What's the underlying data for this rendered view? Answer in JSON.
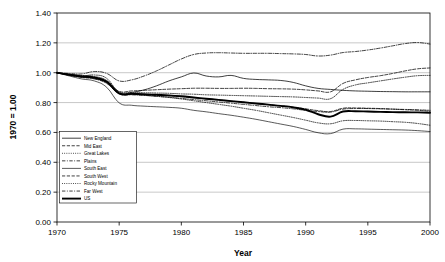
{
  "chart_data": {
    "type": "line",
    "title": "",
    "xlabel": "Year",
    "ylabel": "1970 = 1.00",
    "xlim": [
      1970,
      2000
    ],
    "ylim": [
      0.0,
      1.4
    ],
    "grid": true,
    "legend_position": "inside-lower-left",
    "xticks": [
      "1970",
      "1975",
      "1980",
      "1985",
      "1990",
      "1995",
      "2000"
    ],
    "xtick_values": [
      1970,
      1975,
      1980,
      1985,
      1990,
      1995,
      2000
    ],
    "yticks": [
      "0.00",
      "0.20",
      "0.40",
      "0.60",
      "0.80",
      "1.00",
      "1.20",
      "1.40"
    ],
    "ytick_values": [
      0.0,
      0.2,
      0.4,
      0.6,
      0.8,
      1.0,
      1.2,
      1.4
    ],
    "x": [
      1970,
      1971,
      1972,
      1973,
      1974,
      1975,
      1976,
      1977,
      1978,
      1979,
      1980,
      1981,
      1982,
      1983,
      1984,
      1985,
      1986,
      1987,
      1988,
      1989,
      1990,
      1991,
      1992,
      1993,
      1994,
      1995,
      1996,
      1997,
      1998,
      1999,
      2000
    ],
    "series": [
      {
        "name": "New England",
        "style": "solid",
        "width": 0.75,
        "values": [
          1.0,
          0.985,
          0.972,
          0.962,
          0.935,
          0.862,
          0.868,
          0.885,
          0.912,
          0.945,
          0.972,
          0.998,
          0.978,
          0.972,
          0.982,
          0.962,
          0.955,
          0.952,
          0.948,
          0.935,
          0.912,
          0.895,
          0.888,
          0.882,
          0.878,
          0.876,
          0.874,
          0.873,
          0.872,
          0.872,
          0.872
        ]
      },
      {
        "name": "Mid East",
        "style": "dashed",
        "width": 0.75,
        "values": [
          1.0,
          0.988,
          0.978,
          0.968,
          0.94,
          0.875,
          0.878,
          0.882,
          0.886,
          0.89,
          0.893,
          0.896,
          0.896,
          0.895,
          0.895,
          0.896,
          0.895,
          0.893,
          0.892,
          0.89,
          0.885,
          0.878,
          0.872,
          0.928,
          0.952,
          0.968,
          0.98,
          0.995,
          1.012,
          1.026,
          1.032
        ]
      },
      {
        "name": "Great Lakes",
        "style": "dotted",
        "width": 0.75,
        "values": [
          1.0,
          0.99,
          0.982,
          0.975,
          0.948,
          0.872,
          0.868,
          0.866,
          0.864,
          0.862,
          0.858,
          0.856,
          0.852,
          0.85,
          0.848,
          0.846,
          0.844,
          0.842,
          0.84,
          0.838,
          0.834,
          0.83,
          0.826,
          0.888,
          0.918,
          0.932,
          0.945,
          0.958,
          0.97,
          0.98,
          0.982
        ]
      },
      {
        "name": "Plains",
        "style": "dashdot",
        "width": 0.75,
        "values": [
          1.0,
          0.982,
          0.968,
          0.958,
          0.928,
          0.858,
          0.852,
          0.848,
          0.842,
          0.836,
          0.828,
          0.82,
          0.812,
          0.804,
          0.796,
          0.788,
          0.78,
          0.772,
          0.766,
          0.758,
          0.748,
          0.74,
          0.736,
          0.756,
          0.76,
          0.76,
          0.758,
          0.756,
          0.754,
          0.752,
          0.748
        ]
      },
      {
        "name": "South East",
        "style": "solid",
        "width": 0.65,
        "values": [
          1.0,
          0.978,
          0.958,
          0.945,
          0.902,
          0.798,
          0.782,
          0.776,
          0.772,
          0.768,
          0.762,
          0.748,
          0.738,
          0.726,
          0.715,
          0.702,
          0.688,
          0.672,
          0.656,
          0.64,
          0.62,
          0.598,
          0.592,
          0.622,
          0.624,
          0.622,
          0.62,
          0.618,
          0.616,
          0.612,
          0.606
        ]
      },
      {
        "name": "South West",
        "style": "dashed",
        "width": 0.75,
        "values": [
          1.0,
          0.985,
          0.972,
          0.962,
          0.932,
          0.862,
          0.856,
          0.852,
          0.848,
          0.845,
          0.84,
          0.832,
          0.825,
          0.818,
          0.81,
          0.802,
          0.794,
          0.786,
          0.778,
          0.77,
          0.758,
          0.746,
          0.74,
          0.762,
          0.764,
          0.762,
          0.76,
          0.756,
          0.752,
          0.748,
          0.742
        ]
      },
      {
        "name": "Rocky Mountain",
        "style": "dotted",
        "width": 0.75,
        "values": [
          1.0,
          0.988,
          0.978,
          0.985,
          0.962,
          0.866,
          0.858,
          0.85,
          0.842,
          0.834,
          0.824,
          0.812,
          0.8,
          0.788,
          0.776,
          0.762,
          0.748,
          0.732,
          0.716,
          0.7,
          0.682,
          0.664,
          0.658,
          0.678,
          0.68,
          0.678,
          0.676,
          0.672,
          0.668,
          0.66,
          0.648
        ]
      },
      {
        "name": "Far West",
        "style": "dashdot",
        "width": 0.75,
        "values": [
          1.0,
          0.995,
          0.992,
          1.008,
          0.995,
          0.945,
          0.952,
          0.978,
          1.012,
          1.052,
          1.092,
          1.122,
          1.132,
          1.134,
          1.132,
          1.13,
          1.13,
          1.13,
          1.128,
          1.126,
          1.122,
          1.112,
          1.118,
          1.135,
          1.142,
          1.152,
          1.165,
          1.18,
          1.195,
          1.202,
          1.192
        ]
      },
      {
        "name": "US",
        "style": "solid",
        "width": 1.9,
        "values": [
          1.0,
          0.986,
          0.975,
          0.968,
          0.94,
          0.862,
          0.858,
          0.856,
          0.852,
          0.848,
          0.842,
          0.834,
          0.826,
          0.818,
          0.81,
          0.802,
          0.794,
          0.786,
          0.778,
          0.768,
          0.752,
          0.722,
          0.706,
          0.74,
          0.742,
          0.74,
          0.738,
          0.736,
          0.735,
          0.734,
          0.732
        ]
      }
    ]
  },
  "legend": {
    "items": [
      {
        "label": "New England"
      },
      {
        "label": "Mid East"
      },
      {
        "label": "Great Lakes"
      },
      {
        "label": "Plains"
      },
      {
        "label": "South East"
      },
      {
        "label": "South West"
      },
      {
        "label": "Rocky Mountain"
      },
      {
        "label": "Far West"
      },
      {
        "label": "US"
      }
    ]
  }
}
